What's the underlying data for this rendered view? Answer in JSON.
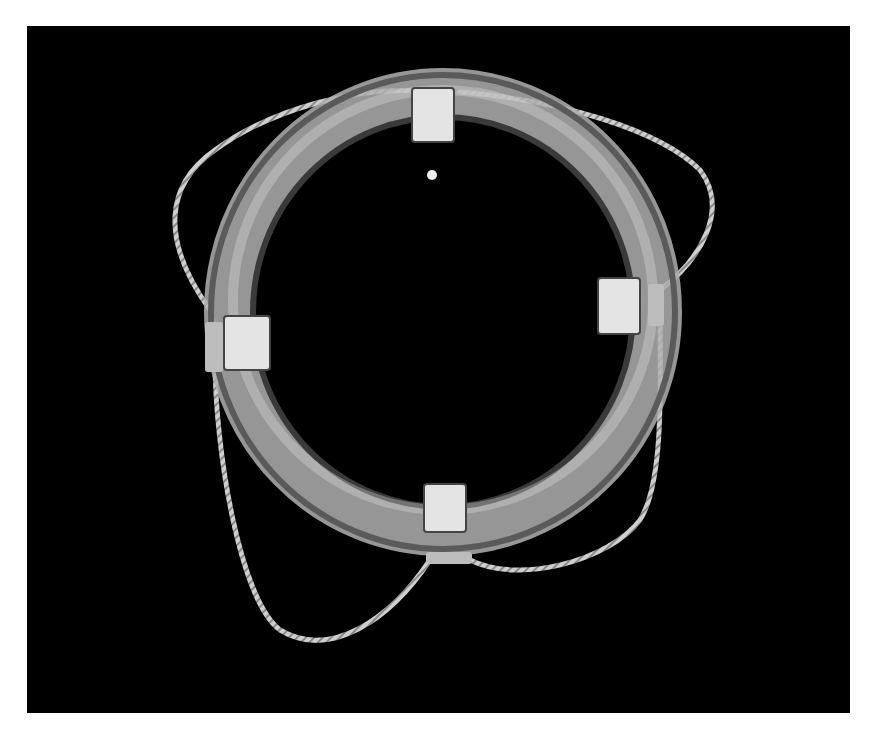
{
  "image": {
    "subject": "Life ring buoy with rope",
    "background_color": "#000000",
    "frame_color": "#ffffff",
    "ring_color": "#b8b8b8",
    "band_color": "#e6e6e6",
    "rope_color": "#c4c4c4"
  }
}
